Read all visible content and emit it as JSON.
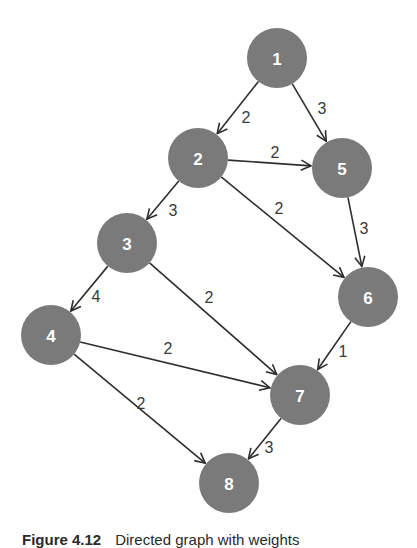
{
  "figure": {
    "caption_label": "Figure 4.12",
    "caption_text": "Directed graph with weights"
  },
  "style": {
    "node_fill": "#7a7a7a",
    "node_label_color": "#ffffff",
    "edge_color": "#2e2e2e",
    "background": "#ffffff"
  },
  "nodes": [
    {
      "id": "1",
      "label": "1",
      "x": 277,
      "y": 58
    },
    {
      "id": "2",
      "label": "2",
      "x": 198,
      "y": 158
    },
    {
      "id": "3",
      "label": "3",
      "x": 127,
      "y": 243
    },
    {
      "id": "4",
      "label": "4",
      "x": 51,
      "y": 335
    },
    {
      "id": "5",
      "label": "5",
      "x": 342,
      "y": 168
    },
    {
      "id": "6",
      "label": "6",
      "x": 368,
      "y": 297
    },
    {
      "id": "7",
      "label": "7",
      "x": 300,
      "y": 395
    },
    {
      "id": "8",
      "label": "8",
      "x": 229,
      "y": 483
    }
  ],
  "edges": [
    {
      "from": "1",
      "to": "2",
      "weight": "2",
      "lx": 246,
      "ly": 117
    },
    {
      "from": "1",
      "to": "5",
      "weight": "3",
      "lx": 322,
      "ly": 108
    },
    {
      "from": "2",
      "to": "5",
      "weight": "2",
      "lx": 275,
      "ly": 152
    },
    {
      "from": "2",
      "to": "6",
      "weight": "2",
      "lx": 279,
      "ly": 208
    },
    {
      "from": "2",
      "to": "3",
      "weight": "3",
      "lx": 173,
      "ly": 210
    },
    {
      "from": "5",
      "to": "6",
      "weight": "3",
      "lx": 364,
      "ly": 228
    },
    {
      "from": "3",
      "to": "4",
      "weight": "4",
      "lx": 96,
      "ly": 296
    },
    {
      "from": "3",
      "to": "7",
      "weight": "2",
      "lx": 209,
      "ly": 297
    },
    {
      "from": "4",
      "to": "7",
      "weight": "2",
      "lx": 168,
      "ly": 348
    },
    {
      "from": "4",
      "to": "8",
      "weight": "2",
      "lx": 141,
      "ly": 403
    },
    {
      "from": "6",
      "to": "7",
      "weight": "1",
      "lx": 343,
      "ly": 351
    },
    {
      "from": "7",
      "to": "8",
      "weight": "3",
      "lx": 269,
      "ly": 447
    }
  ]
}
